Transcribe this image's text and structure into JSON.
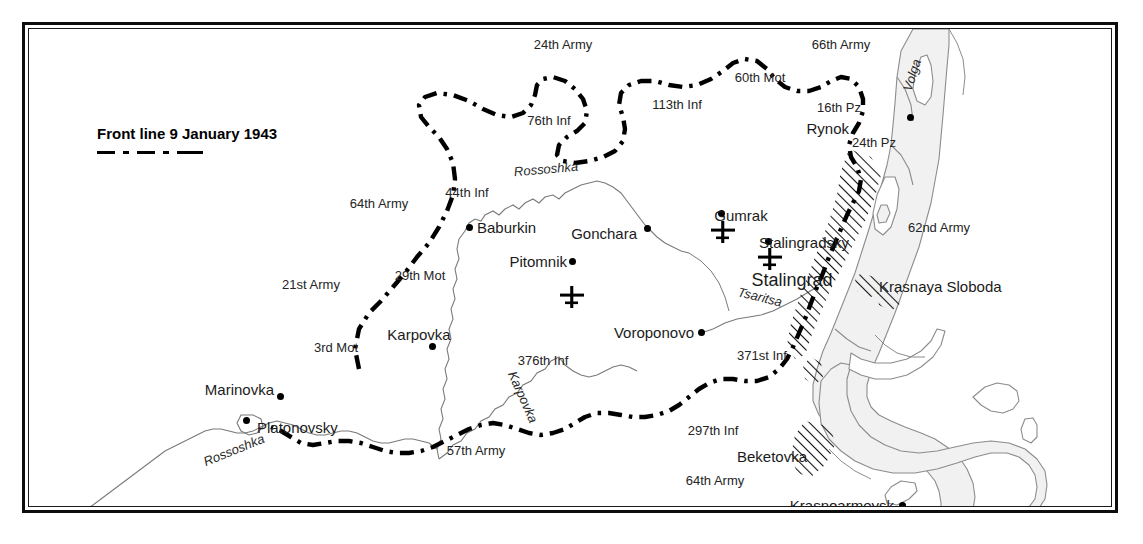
{
  "map": {
    "title": "Stalingrad Pocket — Front line 9 January 1943",
    "legend": {
      "label": "Front line 9 January 1943",
      "symbol": "dash-dot-line"
    },
    "colors": {
      "ink": "#1b1b1b",
      "frame": "#0d0d0d",
      "water_fill": "#f1f1f1",
      "water_stroke": "#8c8c8c",
      "urban_hatch": "#111111",
      "front_line": "#000000"
    },
    "settlements": [
      {
        "name": "Rynok",
        "x": 885,
        "y": 108,
        "anchor": "right",
        "size": "town"
      },
      {
        "name": "Gumrak",
        "x": 712,
        "y": 192,
        "anchor": "center",
        "size": "town"
      },
      {
        "name": "Stalingradsky",
        "x": 775,
        "y": 218,
        "anchor": "center",
        "size": "town"
      },
      {
        "name": "Stalingrad",
        "x": 763,
        "y": 256,
        "anchor": "center",
        "size": "city"
      },
      {
        "name": "Baburkin",
        "x": 489,
        "y": 216,
        "anchor": "left",
        "size": "town"
      },
      {
        "name": "Gonchara",
        "x": 601,
        "y": 224,
        "anchor": "right",
        "size": "town"
      },
      {
        "name": "Pitomnik",
        "x": 529,
        "y": 253,
        "anchor": "right",
        "size": "town"
      },
      {
        "name": "Voroponovo",
        "x": 654,
        "y": 324,
        "anchor": "right",
        "size": "town"
      },
      {
        "name": "Karpovka",
        "x": 388,
        "y": 331,
        "anchor": "center",
        "size": "town"
      },
      {
        "name": "Marinovka",
        "x": 259,
        "y": 381,
        "anchor": "right",
        "size": "town"
      },
      {
        "name": "Platonovsky",
        "x": 278,
        "y": 419,
        "anchor": "left",
        "size": "town"
      },
      {
        "name": "Beketovka",
        "x": 743,
        "y": 448,
        "anchor": "center",
        "size": "town"
      },
      {
        "name": "Krasnoarmeysk",
        "x": 832,
        "y": 495,
        "anchor": "right",
        "size": "town"
      },
      {
        "name": "Krasnaya Sloboda",
        "x": 872,
        "y": 279,
        "anchor": "left",
        "size": "town"
      }
    ],
    "unit_labels": [
      {
        "name": "24th Army",
        "x": 534,
        "y": 37
      },
      {
        "name": "66th Army",
        "x": 812,
        "y": 37
      },
      {
        "name": "60th Mot",
        "x": 731,
        "y": 70
      },
      {
        "name": "113th Inf",
        "x": 648,
        "y": 97
      },
      {
        "name": "16th Pz",
        "x": 810,
        "y": 100
      },
      {
        "name": "76th Inf",
        "x": 520,
        "y": 113
      },
      {
        "name": "24th Pz",
        "x": 845,
        "y": 135
      },
      {
        "name": "44th Inf",
        "x": 438,
        "y": 185
      },
      {
        "name": "64th Army",
        "x": 350,
        "y": 196
      },
      {
        "name": "62nd Army",
        "x": 910,
        "y": 220
      },
      {
        "name": "29th Mot",
        "x": 391,
        "y": 268
      },
      {
        "name": "21st Army",
        "x": 282,
        "y": 277
      },
      {
        "name": "3rd Mot",
        "x": 307,
        "y": 340
      },
      {
        "name": "376th Inf",
        "x": 514,
        "y": 353
      },
      {
        "name": "371st Inf",
        "x": 733,
        "y": 348
      },
      {
        "name": "297th Inf",
        "x": 684,
        "y": 423
      },
      {
        "name": "57th Army",
        "x": 447,
        "y": 443
      },
      {
        "name": "64th Army",
        "x": 686,
        "y": 473
      }
    ],
    "river_labels": [
      {
        "name": "Rossoshka",
        "x": 517,
        "y": 162,
        "rotate": -5
      },
      {
        "name": "Tsaritsa",
        "x": 731,
        "y": 290,
        "rotate": 14
      },
      {
        "name": "Karpovka",
        "x": 494,
        "y": 390,
        "rotate": 66
      },
      {
        "name": "Rossoshka",
        "x": 205,
        "y": 443,
        "rotate": -22
      },
      {
        "name": "Volga",
        "x": 901,
        "y": 68,
        "rotate": -72
      }
    ],
    "airfields": [
      {
        "name": "Gumrak airfield",
        "x": 697,
        "y": 205
      },
      {
        "name": "Stalingradsky airfield",
        "x": 744,
        "y": 232
      },
      {
        "name": "Pitomnik airfield",
        "x": 546,
        "y": 270
      }
    ]
  }
}
